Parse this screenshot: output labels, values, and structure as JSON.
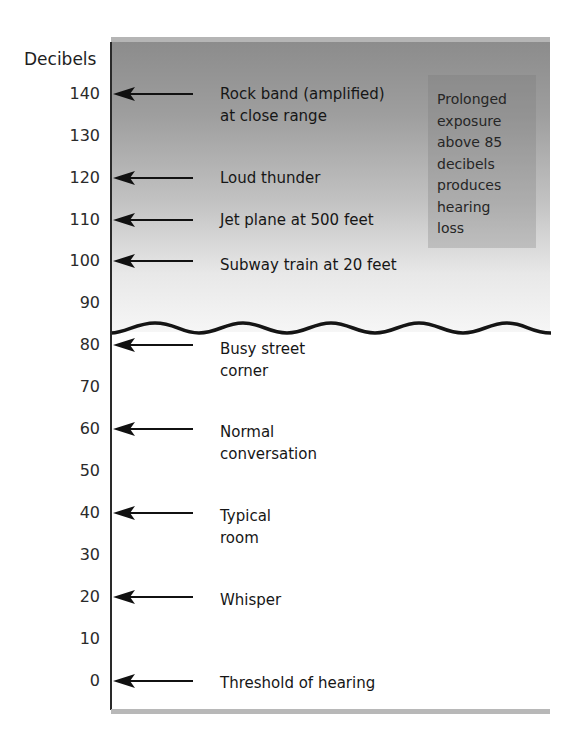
{
  "diagram": {
    "axis_title": "Decibels",
    "ticks": [
      "140",
      "130",
      "120",
      "110",
      "100",
      "90",
      "80",
      "70",
      "60",
      "50",
      "40",
      "30",
      "20",
      "10",
      "0"
    ],
    "threshold_line_db": 85,
    "info_box": {
      "lines": [
        "Prolonged",
        "exposure",
        "above 85",
        "decibels",
        "produces",
        "hearing",
        "loss"
      ]
    },
    "markers": [
      {
        "db": 140,
        "lines": [
          "Rock band (amplified)",
          "at close range"
        ]
      },
      {
        "db": 120,
        "lines": [
          "Loud thunder"
        ]
      },
      {
        "db": 110,
        "lines": [
          "Jet plane at 500 feet"
        ]
      },
      {
        "db": 100,
        "lines": [
          "Subway train at 20 feet"
        ]
      },
      {
        "db": 80,
        "lines": [
          "Busy street",
          "corner"
        ]
      },
      {
        "db": 60,
        "lines": [
          "Normal",
          "conversation"
        ]
      },
      {
        "db": 40,
        "lines": [
          "Typical",
          "room"
        ]
      },
      {
        "db": 20,
        "lines": [
          "Whisper"
        ]
      },
      {
        "db": 0,
        "lines": [
          "Threshold of hearing"
        ]
      }
    ],
    "colors": {
      "gradient_top": "#8c8c8c",
      "gradient_bottom": "#f6f6f6",
      "line": "#1a1a1a",
      "info_box": "#a8a8a8"
    }
  }
}
